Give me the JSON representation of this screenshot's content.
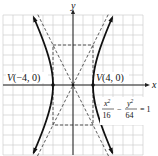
{
  "diagram": {
    "type": "hyperbola-graph",
    "axes": {
      "x_label": "x",
      "y_label": "y"
    },
    "grid": {
      "x_range": [
        -14,
        14
      ],
      "y_range": [
        -14,
        14
      ],
      "step": 2
    },
    "hyperbola": {
      "a": 4,
      "b": 8,
      "orientation": "horizontal",
      "center": [
        0,
        0
      ]
    },
    "asymptotes": [
      {
        "slope": 2
      },
      {
        "slope": -2
      }
    ],
    "fundamental_rectangle": {
      "x": [
        -4,
        4
      ],
      "y": [
        -8,
        8
      ]
    },
    "vertices": [
      {
        "point": [
          -4,
          0
        ],
        "label": "V(−4, 0)",
        "label_prefix": "V",
        "label_coords": "(−4, 0)"
      },
      {
        "point": [
          4,
          0
        ],
        "label": "V(4, 0)",
        "label_prefix": "V",
        "label_coords": "(4, 0)"
      }
    ],
    "equation": {
      "term1_num_var": "x",
      "term1_num_exp": "2",
      "term1_den": "16",
      "minus": "−",
      "term2_num_var": "y",
      "term2_num_exp": "2",
      "term2_den": "64",
      "equals": "= 1"
    }
  }
}
